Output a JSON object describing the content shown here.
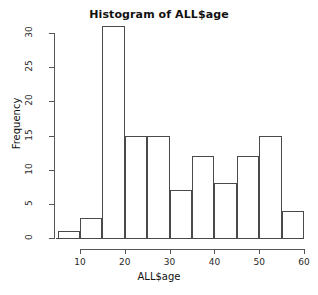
{
  "chart_data": {
    "type": "bar",
    "title": "Histogram of ALL$age",
    "xlabel": "ALL$age",
    "ylabel": "Frequency",
    "bin_width": 5,
    "bin_edges": [
      5,
      10,
      15,
      20,
      25,
      30,
      35,
      40,
      45,
      50,
      55,
      60
    ],
    "categories": [
      "5-10",
      "10-15",
      "15-20",
      "20-25",
      "25-30",
      "30-35",
      "35-40",
      "40-45",
      "45-50",
      "50-55",
      "55-60"
    ],
    "values": [
      1,
      3,
      31,
      15,
      15,
      7,
      12,
      8,
      12,
      15,
      4
    ],
    "xlim": [
      5,
      60
    ],
    "ylim": [
      0,
      31
    ],
    "x_ticks": [
      10,
      20,
      30,
      40,
      50,
      60
    ],
    "x_tick_labels": [
      "10",
      "20",
      "30",
      "40",
      "50",
      "60"
    ],
    "y_ticks": [
      0,
      5,
      10,
      15,
      20,
      25,
      30
    ],
    "y_tick_labels": [
      "0",
      "5",
      "10",
      "15",
      "20",
      "25",
      "30"
    ],
    "grid": false,
    "legend": false,
    "bar_edge_color": "#4a4a4a",
    "bar_fill_color": "transparent",
    "axis_color": "#555555",
    "background_color": "#ffffff"
  }
}
